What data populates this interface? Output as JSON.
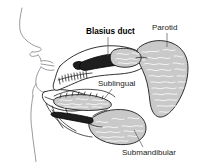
{
  "figure": {
    "background_color": "#ffffff",
    "line_color": "#1c1c1c",
    "face_line_color": "#8e8e96",
    "gland_fill_color": "#c9c9c9",
    "duct_color": "#1e1e1e",
    "leader_color": "#555555",
    "label_color": "#1a1a1a"
  },
  "labels": [
    {
      "id": "blasius-duct",
      "text": "Blasius duct",
      "emphasis": "bold",
      "x": 86,
      "y": 34,
      "leader": {
        "from_x": 108,
        "from_y": 37,
        "to_x": 108,
        "to_y": 56
      }
    },
    {
      "id": "parotid",
      "text": "Parotid",
      "emphasis": "normal",
      "x": 152,
      "y": 30,
      "leader": {
        "from_x": 167,
        "from_y": 33,
        "to_x": 167,
        "to_y": 47
      }
    },
    {
      "id": "sublingual",
      "text": "Sublingual",
      "emphasis": "normal",
      "x": 98,
      "y": 86,
      "leader": {
        "from_x": 112,
        "from_y": 89,
        "to_x": 105,
        "to_y": 99
      }
    },
    {
      "id": "submandibular",
      "text": "Submandibular",
      "emphasis": "normal",
      "x": 122,
      "y": 155,
      "leader": {
        "from_x": 143,
        "from_y": 147,
        "to_x": 134,
        "to_y": 130
      }
    }
  ],
  "structures": [
    {
      "id": "face-profile",
      "name": "face-profile",
      "kind": "line-art"
    },
    {
      "id": "parotid-gland",
      "name": "parotid-gland",
      "kind": "gland"
    },
    {
      "id": "sublingual-gland",
      "name": "sublingual-gland",
      "kind": "gland"
    },
    {
      "id": "submandibular-gland",
      "name": "submandibular-gland",
      "kind": "gland"
    },
    {
      "id": "parotid-duct",
      "name": "parotid-duct",
      "kind": "duct"
    },
    {
      "id": "tongue",
      "name": "tongue",
      "kind": "outline"
    },
    {
      "id": "mandible",
      "name": "mandible",
      "kind": "outline"
    }
  ]
}
